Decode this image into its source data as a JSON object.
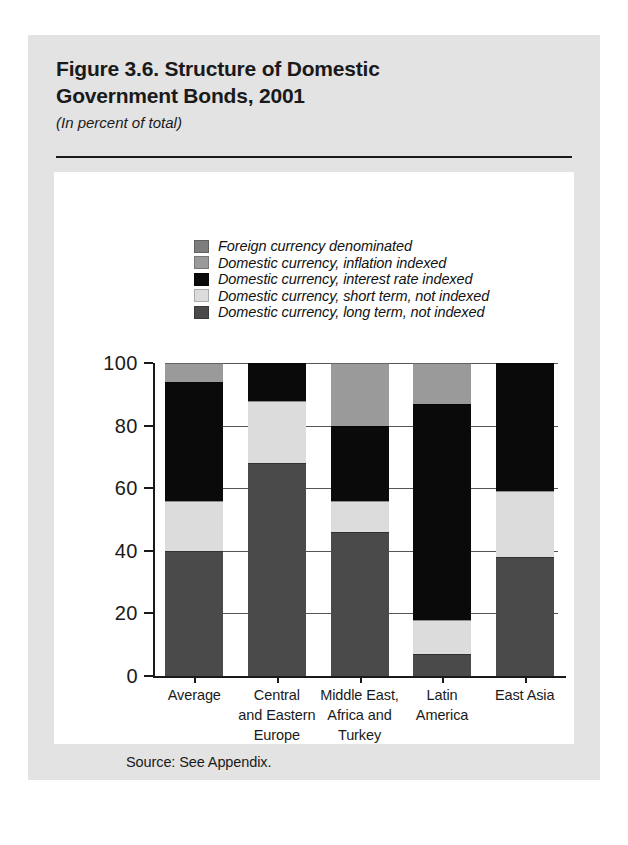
{
  "figure": {
    "title_line1": "Figure 3.6. Structure of Domestic",
    "title_line2": "Government Bonds, 2001",
    "subtitle": "(In percent of total)",
    "source": "Source: See Appendix."
  },
  "colors": {
    "foreign_currency": "#7d7d7d",
    "inflation_indexed": "#9a9a9a",
    "interest_rate_indexed": "#0a0a0a",
    "short_term_not_indexed": "#dcdcdc",
    "long_term_not_indexed": "#4a4a4a",
    "axis": "#1a1a1a",
    "panel_background": "#ffffff",
    "card_background": "#e3e3e3"
  },
  "chart_data": {
    "type": "bar",
    "subtype": "stacked-vertical-100",
    "title": "Figure 3.6. Structure of Domestic Government Bonds, 2001",
    "subtitle": "(In percent of total)",
    "xlabel": "",
    "ylabel": "",
    "ylim": [
      0,
      100
    ],
    "yticks": [
      0,
      20,
      40,
      60,
      80,
      100
    ],
    "ytick_labels": [
      "0",
      "20",
      "40",
      "60",
      "80",
      "100"
    ],
    "grid": false,
    "legend_position": "top-center",
    "categories": [
      "Average",
      "Central and Eastern Europe",
      "Middle East, Africa and Turkey",
      "Latin America",
      "East Asia"
    ],
    "category_label_lines": [
      [
        "Average"
      ],
      [
        "Central",
        "and Eastern",
        "Europe"
      ],
      [
        "Middle East,",
        "Africa and",
        "Turkey"
      ],
      [
        "Latin",
        "America"
      ],
      [
        "East Asia"
      ]
    ],
    "series": [
      {
        "name": "Domestic currency, long term, not indexed",
        "key": "long_term_not_indexed",
        "color": "#4a4a4a",
        "values": [
          40,
          68,
          46,
          7,
          38
        ]
      },
      {
        "name": "Domestic currency, short term, not indexed",
        "key": "short_term_not_indexed",
        "color": "#dcdcdc",
        "values": [
          16,
          20,
          10,
          11,
          21
        ]
      },
      {
        "name": "Domestic currency, interest rate indexed",
        "key": "interest_rate_indexed",
        "color": "#0a0a0a",
        "values": [
          38,
          12,
          24,
          69,
          41
        ]
      },
      {
        "name": "Domestic currency, inflation indexed",
        "key": "inflation_indexed",
        "color": "#9a9a9a",
        "values": [
          6,
          0,
          20,
          13,
          0
        ]
      },
      {
        "name": "Foreign currency denominated",
        "key": "foreign_currency",
        "color": "#7d7d7d",
        "values": [
          0,
          0,
          0,
          0,
          0
        ]
      }
    ],
    "legend_entries": [
      {
        "label": "Foreign currency denominated",
        "color": "#7d7d7d"
      },
      {
        "label": "Domestic currency, inflation indexed",
        "color": "#9a9a9a"
      },
      {
        "label": "Domestic currency, interest rate indexed",
        "color": "#0a0a0a"
      },
      {
        "label": "Domestic currency, short term, not indexed",
        "color": "#dcdcdc"
      },
      {
        "label": "Domestic currency, long term, not indexed",
        "color": "#4a4a4a"
      }
    ]
  }
}
